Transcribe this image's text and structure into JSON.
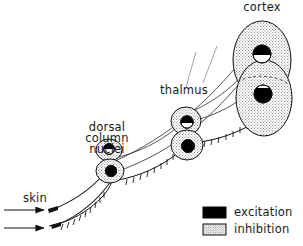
{
  "figure": {
    "title_visible": false,
    "background_color": "#ffffff",
    "ink_color": "#111111"
  },
  "labels": {
    "cortex": "cortex",
    "thalmus": "thalmus",
    "dorsal_column_nuclei_line1": "dorsal",
    "dorsal_column_nuclei_line2": "column",
    "dorsal_column_nuclei_line3": "nuclei",
    "skin": "skin"
  },
  "legend": {
    "items": [
      {
        "label": "excitation",
        "swatch": "solid-black",
        "color": "#000000"
      },
      {
        "label": "inhibition",
        "swatch": "stippled-outline",
        "color": "#ffffff"
      }
    ]
  },
  "structures": [
    {
      "name": "dorsal column nuclei",
      "fill": "stippled",
      "neurons": [
        {
          "position": "upper",
          "excitation_half": "top"
        },
        {
          "position": "lower",
          "excitation_half": "bottom"
        }
      ]
    },
    {
      "name": "thalmus",
      "fill": "stippled",
      "neurons": [
        {
          "position": "upper",
          "excitation_half": "top"
        },
        {
          "position": "lower",
          "excitation_half": "bottom"
        }
      ]
    },
    {
      "name": "cortex",
      "fill": "stippled",
      "neurons": [
        {
          "position": "upper",
          "excitation_half": "top"
        },
        {
          "position": "lower",
          "excitation_half": "bottom"
        }
      ]
    }
  ],
  "inputs": {
    "arrow_count": 2,
    "arrow_direction": "right",
    "source": "skin"
  }
}
